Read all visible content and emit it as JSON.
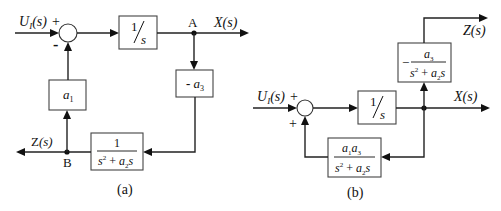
{
  "diagram_a": {
    "caption": "(a)",
    "input_label": "U",
    "input_sub": "I",
    "input_arg": "(s)",
    "sum_sign_input": "+",
    "sum_sign_feedback": "-",
    "integrator": {
      "num": "1",
      "den": "s"
    },
    "node_a_label": "A",
    "output_x_label": "X(s)",
    "gain_a3_block": {
      "sign": "- ",
      "sym": "a",
      "sub": "3"
    },
    "plant_block": {
      "num": "1",
      "den_s": "s",
      "den_sup": "2",
      "den_plus": " + ",
      "den_a": "a",
      "den_sub": "2",
      "den_tail": "s"
    },
    "node_b_label": "B",
    "output_z_label": "Z(s)",
    "gain_a1_block": {
      "sym": "a",
      "sub": "1"
    }
  },
  "diagram_b": {
    "caption": "(b)",
    "input_label": "U",
    "input_sub": "I",
    "input_arg": "(s)",
    "sum_sign_input": "+",
    "sum_sign_feedback": "+",
    "integrator": {
      "num": "1",
      "den": "s"
    },
    "output_x_label": "X(s)",
    "output_z_label": "Z(s)",
    "z_block": {
      "sign": "−",
      "num_a": "a",
      "num_sub": "3",
      "den_s": "s",
      "den_sup": "2",
      "den_plus": " + ",
      "den_a": "a",
      "den_sub": "2",
      "den_tail": "s"
    },
    "feedback_block": {
      "num_a1": "a",
      "num_sub1": "1",
      "num_a3": "a",
      "num_sub3": "3",
      "den_s": "s",
      "den_sup": "2",
      "den_plus": " + ",
      "den_a": "a",
      "den_sub": "2",
      "den_tail": "s"
    }
  }
}
